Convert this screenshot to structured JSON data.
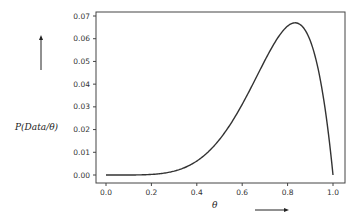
{
  "chart_data": {
    "type": "line",
    "title": "",
    "xlabel": "θ",
    "ylabel": "P(Data/θ)",
    "xlim": [
      0.0,
      1.0
    ],
    "ylim": [
      0.0,
      0.07
    ],
    "xticks": [
      "0.0",
      "0.2",
      "0.4",
      "0.6",
      "0.8",
      "1.0"
    ],
    "yticks": [
      "0.00",
      "0.01",
      "0.02",
      "0.03",
      "0.04",
      "0.05",
      "0.06",
      "0.07"
    ],
    "grid": false,
    "legend": null,
    "series": [
      {
        "name": "likelihood",
        "color": "#333333",
        "x": [
          0.0,
          0.1,
          0.2,
          0.3,
          0.4,
          0.5,
          0.6,
          0.7,
          0.8,
          0.833,
          0.9,
          0.95,
          1.0
        ],
        "y": [
          0.0,
          1e-05,
          0.00026,
          0.0017,
          0.0061,
          0.0156,
          0.0311,
          0.0504,
          0.0655,
          0.067,
          0.059,
          0.0387,
          0.0
        ]
      }
    ],
    "annotations": [
      {
        "type": "arrow",
        "direction": "up",
        "near": "ylabel"
      },
      {
        "type": "arrow",
        "direction": "right",
        "near": "xlabel"
      }
    ]
  }
}
